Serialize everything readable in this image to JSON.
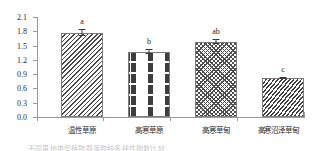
{
  "chart_data": {
    "type": "bar",
    "title": "",
    "xlabel": "",
    "ylabel": "Pielou均匀度指数",
    "categories": [
      "温性草原",
      "高寒草原",
      "高寒草甸",
      "高寒沼泽草甸"
    ],
    "values": [
      1.77,
      1.37,
      1.58,
      0.82
    ],
    "errors": [
      0.07,
      0.05,
      0.05,
      0.03
    ],
    "annotations": [
      "a",
      "b",
      "ab",
      "c"
    ],
    "ylim": [
      0.0,
      2.1
    ],
    "yticks": [
      "0.0",
      "0.3",
      "0.6",
      "0.9",
      "1.2",
      "1.5",
      "1.8",
      "2.1"
    ],
    "ytick_values": [
      0.0,
      0.3,
      0.6,
      0.9,
      1.2,
      1.5,
      1.8,
      2.1
    ],
    "grid": false,
    "legend": "none",
    "bar_patterns": [
      "diagonal-hatch",
      "horizontal-dashes",
      "crosshatch-diamond",
      "dense-diagonal-hatch"
    ],
    "colors": {
      "bar_fill": "#ffffff",
      "bar_edge": "#7d7d7d",
      "pattern": "#3f3f3f",
      "axis": "#9a9a9a",
      "text": "#2b2b2b"
    }
  },
  "caption": {
    "text": "不同草地类型植物群落物种多样性指数比较"
  }
}
